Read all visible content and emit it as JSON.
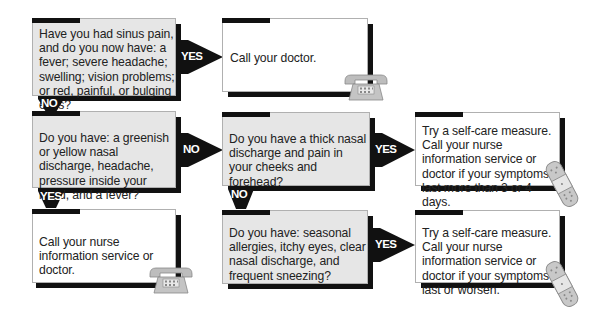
{
  "boxes": {
    "q1": "Have you had sinus pain, and do you now have: a fever; severe headache; swelling; vision problems; or red, painful, or bulging eyes?",
    "a1": "Call your doctor.",
    "q2": "Do you have: a greenish or yellow nasal discharge, headache, pressure inside your head, and a fever?",
    "q3": "Do you have a thick nasal discharge and pain in your cheeks and forehead?",
    "a3": "Try a self-care measure. Call your nurse information service or doctor if your symptoms last more than 3 or 4 days.",
    "a2": "Call your nurse information service or doctor.",
    "q4": "Do you have: seasonal allergies, itchy eyes, clear nasal discharge, and frequent sneezing?",
    "a4": "Try a self-care measure. Call your nurse information service or doctor if your symptoms last or worsen."
  },
  "labels": {
    "q1_yes": "YES",
    "q1_no": "NO",
    "q2_no": "NO",
    "q2_yes": "YES",
    "q3_yes": "YES",
    "q3_no": "NO",
    "q4_yes": "YES"
  },
  "icons": {
    "phone": "telephone-icon",
    "bandage": "bandage-icon"
  },
  "colors": {
    "question_bg": "#e6e6e6",
    "answer_bg": "#ffffff",
    "arrow": "#111111",
    "icon": "#b8b8b8"
  }
}
